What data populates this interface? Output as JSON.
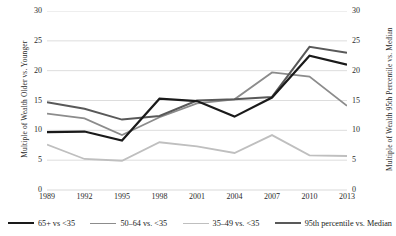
{
  "chart_data": {
    "type": "line",
    "title": "",
    "xlabel": "",
    "ylabel": "Multiple of Wealth Older vs. Younger",
    "y2label": "Multiple of Wealth 95th Percentile vs. Median",
    "categories": [
      "1989",
      "1992",
      "1995",
      "1998",
      "2001",
      "2004",
      "2007",
      "2010",
      "2013"
    ],
    "ylim": [
      0,
      30
    ],
    "y2lim": [
      0,
      30
    ],
    "yticks": [
      0,
      5,
      10,
      15,
      20,
      25,
      30
    ],
    "y2ticks": [
      0,
      5,
      10,
      15,
      20,
      25,
      30
    ],
    "grid": "horizontal",
    "legend_position": "bottom",
    "series": [
      {
        "name": "65+ vs <35",
        "axis": "left",
        "color": "#1a1a1a",
        "width": 2.2,
        "values": [
          9.7,
          9.8,
          8.3,
          15.3,
          14.9,
          12.3,
          15.5,
          22.5,
          21.0
        ]
      },
      {
        "name": "50–64 vs. <35",
        "axis": "left",
        "color": "#8c8c8c",
        "width": 1.8,
        "values": [
          12.8,
          12.0,
          9.2,
          12.2,
          14.5,
          15.2,
          19.7,
          19.0,
          14.1
        ]
      },
      {
        "name": "35–49 vs. <35",
        "axis": "left",
        "color": "#bfbfbf",
        "width": 1.8,
        "values": [
          7.6,
          5.2,
          4.9,
          8.0,
          7.3,
          6.2,
          9.2,
          5.8,
          5.7
        ]
      },
      {
        "name": "95th percentile vs. Median",
        "axis": "right",
        "color": "#595959",
        "width": 2.0,
        "values": [
          14.7,
          13.6,
          11.8,
          12.4,
          15.0,
          15.2,
          15.6,
          24.0,
          23.0
        ]
      }
    ]
  },
  "axes": {
    "left_title": "Multiple of Wealth Older vs. Younger",
    "right_title": "Multiple of Wealth 95th Percentile vs. Median"
  },
  "legend": {
    "items": [
      {
        "label": "65+ vs <35",
        "color": "#1a1a1a",
        "width": 2.4
      },
      {
        "label": "50–64 vs. <35",
        "color": "#8c8c8c",
        "width": 1.9
      },
      {
        "label": "35–49 vs. <35",
        "color": "#bfbfbf",
        "width": 1.9
      },
      {
        "label": "95th percentile vs. Median",
        "color": "#595959",
        "width": 2.2
      }
    ]
  },
  "style": {
    "grid_color": "#d9d9d9",
    "text_color": "#2b2b2b",
    "background": "#ffffff"
  }
}
